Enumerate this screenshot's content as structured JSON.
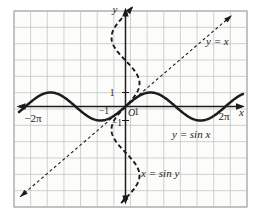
{
  "colors": {
    "ink": "#1c1c1c",
    "grid": "#bdbdbd",
    "frame": "#8f8f8f",
    "plot_bg": "#fcfcfb",
    "page_bg": "#ffffff"
  },
  "chart_data": {
    "type": "line",
    "title": "",
    "xlabel": "x",
    "ylabel": "y",
    "origin_label": "O",
    "grid": true,
    "grid_cells": {
      "cols": 14,
      "rows": 12
    },
    "x_tick_labels": {
      "neg_two_pi": "−2π",
      "neg_one": "−1",
      "one": "1",
      "two_pi": "2π"
    },
    "y_tick_labels": {
      "one": "1",
      "neg_one": "−1"
    },
    "axis_arrows": "both-ends",
    "series": [
      {
        "name": "y = sin x",
        "fn": "y = sin(x)",
        "style": "solid",
        "weight": "bold",
        "amplitude": 1,
        "domain_pi": [
          -2.13,
          2.35
        ],
        "label": "y = sin x"
      },
      {
        "name": "x = sin y",
        "fn": "x = sin(y)",
        "style": "dashed",
        "weight": "bold",
        "amplitude": 1,
        "domain_pi": [
          -2.1,
          2.18
        ],
        "label": "x = sin y"
      },
      {
        "name": "y = x",
        "fn": "y = x",
        "style": "dashed",
        "weight": "thin",
        "domain_pi": [
          -2.11,
          2.13
        ],
        "label": "y = x"
      }
    ],
    "xlim_pi": [
      -2.4,
      2.4
    ],
    "ylim_pi": [
      -2.2,
      2.1
    ]
  }
}
